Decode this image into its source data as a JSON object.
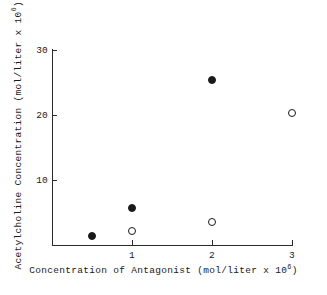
{
  "chart_data": {
    "type": "scatter",
    "title": "",
    "xlabel_text": "Concentration of Antagonist (mol/liter x 10",
    "xlabel_exponent": "6",
    "xlabel_suffix": ")",
    "ylabel_text": "Acetylcholine Concentration (mol/liter x 10",
    "ylabel_exponent": "6",
    "ylabel_suffix": ")",
    "xlim": [
      0,
      3.1
    ],
    "ylim": [
      0,
      30.5
    ],
    "xticks": [
      {
        "value": 1,
        "label": "1"
      },
      {
        "value": 2,
        "label": "2"
      },
      {
        "value": 3,
        "label": "3"
      }
    ],
    "yticks": [
      {
        "value": 10,
        "label": "10"
      },
      {
        "value": 20,
        "label": "20"
      },
      {
        "value": 30,
        "label": "30"
      }
    ],
    "grid": false,
    "legend": "none",
    "series": [
      {
        "name": "filled-circles",
        "marker": "filled-circle",
        "color": "#1a1a1a",
        "points": [
          {
            "x": 0.5,
            "y": 1.4
          },
          {
            "x": 1.0,
            "y": 5.7
          },
          {
            "x": 2.0,
            "y": 25.4
          }
        ]
      },
      {
        "name": "open-circles",
        "marker": "open-circle",
        "color": "#1a1a1a",
        "points": [
          {
            "x": 1.0,
            "y": 2.2
          },
          {
            "x": 2.0,
            "y": 3.5
          },
          {
            "x": 3.0,
            "y": 20.3
          }
        ]
      }
    ]
  }
}
